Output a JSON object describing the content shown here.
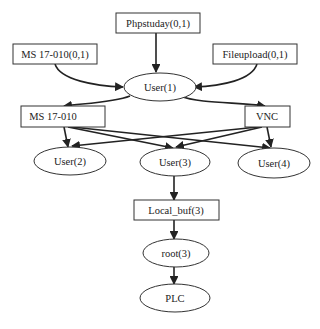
{
  "diagram": {
    "type": "attack-graph",
    "colors": {
      "stroke": "#333333",
      "text": "#222222",
      "background": "#ffffff"
    },
    "nodes": {
      "phpstuday": {
        "label": "Phpstuday(0,1)",
        "shape": "box"
      },
      "ms17010_src": {
        "label": "MS 17-010(0,1)",
        "shape": "box"
      },
      "fileupload": {
        "label": "Fileupload(0,1)",
        "shape": "box"
      },
      "user1": {
        "label": "User(1)",
        "shape": "ellipse"
      },
      "ms17010": {
        "label": "MS 17-010",
        "shape": "box"
      },
      "vnc": {
        "label": "VNC",
        "shape": "box"
      },
      "user2": {
        "label": "User(2)",
        "shape": "ellipse"
      },
      "user3": {
        "label": "User(3)",
        "shape": "ellipse"
      },
      "user4": {
        "label": "User(4)",
        "shape": "ellipse"
      },
      "local_buf": {
        "label": "Local_buf(3)",
        "shape": "box"
      },
      "root3": {
        "label": "root(3)",
        "shape": "ellipse"
      },
      "plc": {
        "label": "PLC",
        "shape": "ellipse"
      }
    },
    "edges": [
      {
        "from": "Phpstuday(0,1)",
        "to": "User(1)"
      },
      {
        "from": "MS 17-010(0,1)",
        "to": "User(1)"
      },
      {
        "from": "Fileupload(0,1)",
        "to": "User(1)"
      },
      {
        "from": "User(1)",
        "to": "MS 17-010"
      },
      {
        "from": "User(1)",
        "to": "VNC"
      },
      {
        "from": "MS 17-010",
        "to": "User(2)"
      },
      {
        "from": "MS 17-010",
        "to": "User(3)"
      },
      {
        "from": "MS 17-010",
        "to": "User(4)"
      },
      {
        "from": "VNC",
        "to": "User(2)"
      },
      {
        "from": "VNC",
        "to": "User(3)"
      },
      {
        "from": "VNC",
        "to": "User(4)"
      },
      {
        "from": "User(3)",
        "to": "Local_buf(3)"
      },
      {
        "from": "Local_buf(3)",
        "to": "root(3)"
      },
      {
        "from": "root(3)",
        "to": "PLC"
      }
    ]
  }
}
